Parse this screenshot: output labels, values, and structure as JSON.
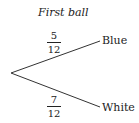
{
  "title": "First ball",
  "branches": [
    {
      "name": "Blue",
      "numerator": "5",
      "denominator": "12"
    },
    {
      "name": "White",
      "numerator": "7",
      "denominator": "12"
    }
  ]
}
